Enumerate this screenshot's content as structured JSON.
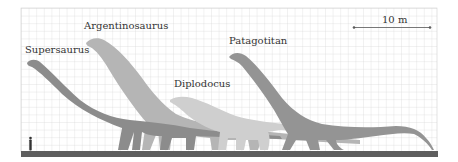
{
  "figure": {
    "scale_bar": {
      "label": "10 m"
    },
    "species": [
      {
        "name": "Supersaurus",
        "color": "#8a8a8a"
      },
      {
        "name": "Argentinosaurus",
        "color": "#b3b3b3"
      },
      {
        "name": "Diplodocus",
        "color": "#cfcfcf"
      },
      {
        "name": "Patagotitan",
        "color": "#939393"
      }
    ],
    "human": {
      "name": "human-silhouette",
      "color": "#333333"
    },
    "colors": {
      "grid": "#d4d4d4",
      "ground": "#5e5e5e",
      "background": "#ffffff"
    }
  }
}
